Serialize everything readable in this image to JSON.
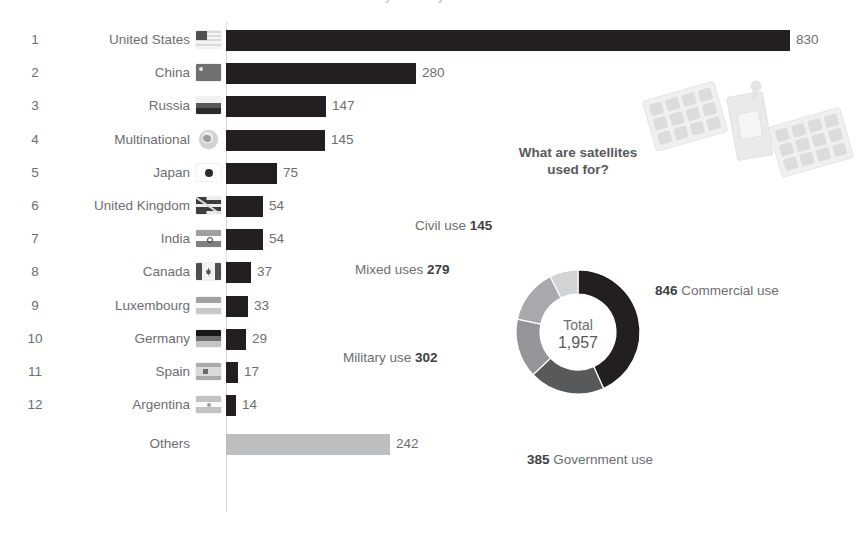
{
  "header": {
    "cutoff_title": "Number of satellites in orbit by country"
  },
  "chart_data": [
    {
      "type": "bar",
      "orientation": "horizontal",
      "title": "Number of satellites in orbit by country",
      "xlabel": "",
      "ylabel": "",
      "xlim": [
        0,
        830
      ],
      "grid": false,
      "categories": [
        "United States",
        "China",
        "Russia",
        "Multinational",
        "Japan",
        "United Kingdom",
        "India",
        "Canada",
        "Luxembourg",
        "Germany",
        "Spain",
        "Argentina",
        "Others"
      ],
      "values": [
        830,
        280,
        147,
        145,
        75,
        54,
        54,
        37,
        33,
        29,
        17,
        14,
        242
      ],
      "ranks": [
        "1",
        "2",
        "3",
        "4",
        "5",
        "6",
        "7",
        "8",
        "9",
        "10",
        "11",
        "12",
        ""
      ],
      "flag_icons": [
        "flag-us-icon",
        "flag-cn-icon",
        "flag-ru-icon",
        "globe-multinational-icon",
        "flag-jp-icon",
        "flag-uk-icon",
        "flag-in-icon",
        "flag-ca-icon",
        "flag-lu-icon",
        "flag-de-icon",
        "flag-es-icon",
        "flag-ar-icon",
        ""
      ],
      "bar_color": "#231f20",
      "others_bar_color": "#bcbec0"
    },
    {
      "type": "pie",
      "variant": "donut",
      "title": "What are satellites used for?",
      "center_label": "Total",
      "center_value": "1,957",
      "total": 1957,
      "labels": [
        "Commercial use",
        "Government use",
        "Military use",
        "Mixed uses",
        "Civil use"
      ],
      "values": [
        846,
        385,
        302,
        279,
        145
      ],
      "colors": [
        "#231f20",
        "#58595b",
        "#939598",
        "#a7a9ac",
        "#d1d3d4"
      ],
      "annotations": [
        {
          "text": "846 Commercial use",
          "value": "846",
          "name": "Commercial use",
          "position": "right"
        },
        {
          "text": "385 Government use",
          "value": "385",
          "name": "Government use",
          "position": "bottom"
        },
        {
          "text": "Military use 302",
          "value": "302",
          "name": "Military use",
          "position": "left"
        },
        {
          "text": "Mixed uses 279",
          "value": "279",
          "name": "Mixed uses",
          "position": "upper-left"
        },
        {
          "text": "Civil use 145",
          "value": "145",
          "name": "Civil use",
          "position": "top-left"
        }
      ]
    }
  ],
  "bars": {
    "rows": [
      {
        "rank": "1",
        "country": "United States",
        "value": "830",
        "flag": "flag-us-icon"
      },
      {
        "rank": "2",
        "country": "China",
        "value": "280",
        "flag": "flag-cn-icon"
      },
      {
        "rank": "3",
        "country": "Russia",
        "value": "147",
        "flag": "flag-ru-icon"
      },
      {
        "rank": "4",
        "country": "Multinational",
        "value": "145",
        "flag": "globe-multinational-icon"
      },
      {
        "rank": "5",
        "country": "Japan",
        "value": "75",
        "flag": "flag-jp-icon"
      },
      {
        "rank": "6",
        "country": "United Kingdom",
        "value": "54",
        "flag": "flag-uk-icon"
      },
      {
        "rank": "7",
        "country": "India",
        "value": "54",
        "flag": "flag-in-icon"
      },
      {
        "rank": "8",
        "country": "Canada",
        "value": "37",
        "flag": "flag-ca-icon"
      },
      {
        "rank": "9",
        "country": "Luxembourg",
        "value": "33",
        "flag": "flag-lu-icon"
      },
      {
        "rank": "10",
        "country": "Germany",
        "value": "29",
        "flag": "flag-de-icon"
      },
      {
        "rank": "11",
        "country": "Spain",
        "value": "17",
        "flag": "flag-es-icon"
      },
      {
        "rank": "12",
        "country": "Argentina",
        "value": "14",
        "flag": "flag-ar-icon"
      },
      {
        "rank": "",
        "country": "Others",
        "value": "242",
        "flag": ""
      }
    ]
  },
  "donut": {
    "title_line1": "What are satellites",
    "title_line2": "used for?",
    "center_label": "Total",
    "center_value": "1,957",
    "label_commercial_value": "846",
    "label_commercial_name": "Commercial use",
    "label_government_value": "385",
    "label_government_name": "Government use",
    "label_military_name": "Military use",
    "label_military_value": "302",
    "label_mixed_name": "Mixed uses",
    "label_mixed_value": "279",
    "label_civil_name": "Civil use",
    "label_civil_value": "145"
  },
  "colors": {
    "bar_dark": "#231f20",
    "bar_light": "#bcbec0",
    "text": "#6d6e71",
    "axis": "#d6d7d8",
    "seg_commercial": "#231f20",
    "seg_government": "#58595b",
    "seg_military": "#939598",
    "seg_mixed": "#a7a9ac",
    "seg_civil": "#d1d3d4"
  }
}
